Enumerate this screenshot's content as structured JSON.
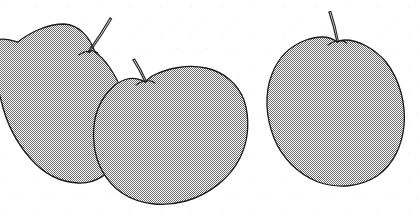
{
  "meta": {
    "width": 418,
    "height": 216,
    "medium": "scanned black-and-white line art with dithered halftone fill",
    "subject_count": "3",
    "alt_text": "Three overlapping apples drawn in outline with dotted gray shading, each with a short stem."
  },
  "colors": {
    "background": "#ffffff",
    "outline": "#1a1a1a",
    "fill_apparent_gray": "#b4b4b4",
    "dither_dark": "#555555",
    "dither_light": "#ffffff",
    "stem_outline": "#2b2b2b",
    "scan_speck": "#cccccc"
  },
  "objects": [
    {
      "id": "apple-left",
      "label": "Apple 1 (rear left, largest, clipped by left edge)",
      "center": {
        "x": 62,
        "y": 112
      },
      "size": {
        "width": 150,
        "height": 175
      },
      "z_order": "1",
      "clipped_edges": "left",
      "stem": {
        "id": "stem-left",
        "label": "Stem of left apple",
        "base": {
          "x": 88,
          "y": 52
        },
        "tip": {
          "x": 110,
          "y": 18
        },
        "length_px": "40",
        "lean": "leaning right"
      },
      "outline_path": "M -20 44 C 2 36 10 40 18 42 C 30 32 48 24 64 24 C 80 25 90 38 95 52 C 104 58 116 74 122 92 C 129 112 128 136 120 155 C 112 173 96 184 78 183 C 58 182 42 172 30 158 C 16 142 6 122 1 100 C -5 78 -10 58 -20 48 Z",
      "fill_path": "M -20 44 C 2 36 10 40 18 42 C 30 32 48 24 64 24 C 80 25 90 38 95 52 C 104 58 116 74 122 92 C 129 112 128 136 120 155 C 112 173 96 184 78 183 C 58 182 42 172 30 158 C 16 142 6 122 1 100 C -5 78 -10 58 -20 48 Z"
    },
    {
      "id": "apple-middle",
      "label": "Apple 2 (front middle, overlaps left apple)",
      "center": {
        "x": 180,
        "y": 133
      },
      "size": {
        "width": 140,
        "height": 138
      },
      "z_order": "2",
      "clipped_edges": "none",
      "stem": {
        "id": "stem-middle",
        "label": "Stem of middle apple (short, hooked)",
        "base": {
          "x": 145,
          "y": 82
        },
        "tip": {
          "x": 133,
          "y": 60
        },
        "length_px": "24",
        "lean": "leaning left, curled"
      },
      "outline_path": "M 145 82 C 132 74 118 80 108 92 C 96 106 92 124 94 144 C 96 164 106 182 122 193 C 140 205 164 207 186 201 C 210 194 230 178 240 158 C 249 140 250 118 244 100 C 238 84 224 72 206 68 C 188 64 168 68 152 76 C 149 78 147 80 145 82 Z",
      "fill_path": "M 145 82 C 132 74 118 80 108 92 C 96 106 92 124 94 144 C 96 164 106 182 122 193 C 140 205 164 207 186 201 C 210 194 230 178 240 158 C 249 140 250 118 244 100 C 238 84 224 72 206 68 C 188 64 168 68 152 76 C 149 78 147 80 145 82 Z"
    },
    {
      "id": "apple-right",
      "label": "Apple 3 (standalone, right side)",
      "center": {
        "x": 337,
        "y": 120
      },
      "size": {
        "width": 136,
        "height": 132
      },
      "z_order": "3",
      "clipped_edges": "none",
      "stem": {
        "id": "stem-right",
        "label": "Stem of right apple (near vertical)",
        "base": {
          "x": 337,
          "y": 42
        },
        "tip": {
          "x": 329,
          "y": 12
        },
        "length_px": "32",
        "lean": "near vertical, slight left tilt"
      },
      "outline_path": "M 337 42 C 330 36 318 36 306 40 C 290 46 278 58 272 74 C 264 94 266 118 274 138 C 282 158 298 174 318 182 C 338 189 360 187 377 176 C 393 165 402 146 404 126 C 406 104 400 80 386 62 C 374 48 358 40 345 40 C 342 40 339 41 337 42 Z",
      "fill_path": "M 337 42 C 330 36 318 36 306 40 C 290 46 278 58 272 74 C 264 94 266 118 274 138 C 282 158 298 174 318 182 C 338 189 360 187 377 176 C 393 165 402 146 404 126 C 406 104 400 80 386 62 C 374 48 358 40 345 40 C 342 40 339 41 337 42 Z"
    }
  ],
  "render": {
    "stroke_width": "1.3",
    "dither_tile_px": "2",
    "fill_opacity": "1"
  }
}
